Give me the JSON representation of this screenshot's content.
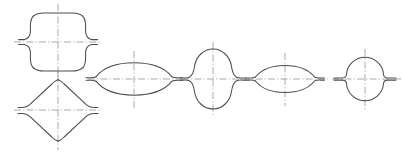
{
  "figure": {
    "width": 403,
    "height": 155,
    "background_color": "#ffffff",
    "outline_color": "#4d4d4d",
    "centerline_color": "#9a9a9a",
    "outline_stroke_width": 1.05,
    "centerline_stroke_width": 0.85,
    "centerline_style": "dash-dot chain line",
    "shape_count": 6,
    "labels": []
  },
  "shapes": [
    {
      "id": "shape-1",
      "name": "rounded-rectangle-profile",
      "description": "Rounded rectangular closed profile with flared waist flanges",
      "center_x": 58,
      "center_y": 42,
      "half_width": 37,
      "half_height": 27,
      "outline_path": "M 32 19 Q 32 15 38 15 L 79 15 Q 85 15 85 19 L 85 30 Q 85 38 93 40 L 32 40 Q 32 38 32 30 Z",
      "vertical_centerline": {
        "x": 58,
        "y1": 5,
        "y2": 79
      },
      "horizontal_centerline": {
        "y": 42,
        "x1": 14,
        "x2": 102
      }
    },
    {
      "id": "shape-2",
      "name": "diamond-rhombus-profile",
      "description": "Diamond (rhombus) closed profile with rounded apexes and waist flanges",
      "center_x": 58,
      "center_y": 110,
      "half_width": 38,
      "half_height": 31,
      "vertical_centerline": {
        "x": 58,
        "y1": 73,
        "y2": 148
      },
      "horizontal_centerline": {
        "y": 110,
        "x1": 14,
        "x2": 102
      }
    },
    {
      "id": "shape-3",
      "name": "wide-lens-profile",
      "description": "Wide bi-convex lens profile with pointed tips and flanges",
      "center_x": 134,
      "center_y": 79,
      "half_width": 40,
      "half_height": 17,
      "vertical_centerline": {
        "x": 134,
        "y1": 52,
        "y2": 106
      },
      "horizontal_centerline": {
        "y": 79,
        "x1": 88,
        "x2": 180
      }
    },
    {
      "id": "shape-4",
      "name": "vertical-oval-profile",
      "description": "Tall vertical oval profile with outward flared waist flanges",
      "center_x": 213,
      "center_y": 79,
      "half_width": 21,
      "half_height": 30,
      "vertical_centerline": {
        "x": 213,
        "y1": 43,
        "y2": 115
      },
      "horizontal_centerline": {
        "y": 79,
        "x1": 182,
        "x2": 244
      }
    },
    {
      "id": "shape-5",
      "name": "flat-lens-profile",
      "description": "Flattened wide lens profile with tip flanges",
      "center_x": 285,
      "center_y": 79,
      "half_width": 36,
      "half_height": 14,
      "vertical_centerline": {
        "x": 285,
        "y1": 54,
        "y2": 104
      },
      "horizontal_centerline": {
        "y": 79,
        "x1": 243,
        "x2": 327
      }
    },
    {
      "id": "shape-6",
      "name": "circular-profile",
      "description": "Circular profile with short horizontal waist flanges",
      "center_x": 365,
      "center_y": 79,
      "radius": 22,
      "vertical_centerline": {
        "x": 365,
        "y1": 50,
        "y2": 108
      },
      "horizontal_centerline": {
        "y": 79,
        "x1": 333,
        "x2": 399
      }
    }
  ]
}
